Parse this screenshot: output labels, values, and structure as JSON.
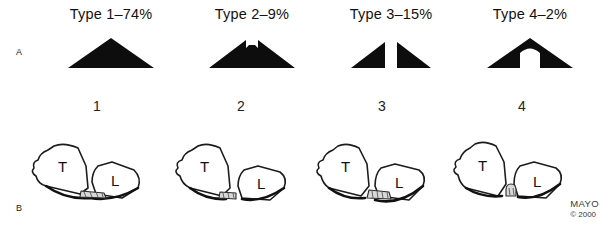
{
  "figure": {
    "panels": [
      {
        "letter": "A"
      },
      {
        "letter": "B"
      }
    ],
    "credit": {
      "name": "MAYO",
      "year": "© 2000"
    }
  },
  "panel_a": {
    "columns": [
      {
        "label": "Type 1–74%",
        "type_name": "Type 1",
        "percent": "74%",
        "glyph": "solid-triangle"
      },
      {
        "label": "Type 2–9%",
        "type_name": "Type 2",
        "percent": "9%",
        "glyph": "notched-apex-triangle"
      },
      {
        "label": "Type 3–15%",
        "type_name": "Type 3",
        "percent": "15%",
        "glyph": "split-triangle-pair"
      },
      {
        "label": "Type 4–2%",
        "type_name": "Type 4",
        "percent": "2%",
        "glyph": "arch-notch-triangle"
      }
    ]
  },
  "panel_b": {
    "columns": [
      {
        "number": "1",
        "bone_labels": {
          "proximal": "T",
          "distal": "L"
        },
        "fragment": "hatched-wedge-bridging"
      },
      {
        "number": "2",
        "bone_labels": {
          "proximal": "T",
          "distal": "L"
        },
        "fragment": "hatched-wedge-attached"
      },
      {
        "number": "3",
        "bone_labels": {
          "proximal": "T",
          "distal": "L"
        },
        "fragment": "hatched-wedge-distal"
      },
      {
        "number": "4",
        "bone_labels": {
          "proximal": "T",
          "distal": "L"
        },
        "fragment": "small-round-fragment"
      }
    ]
  },
  "colors": {
    "ink": "#111111",
    "paper": "#ffffff",
    "fragment_fill": "#d8d8d8",
    "credit_text": "#3a3a3a"
  }
}
